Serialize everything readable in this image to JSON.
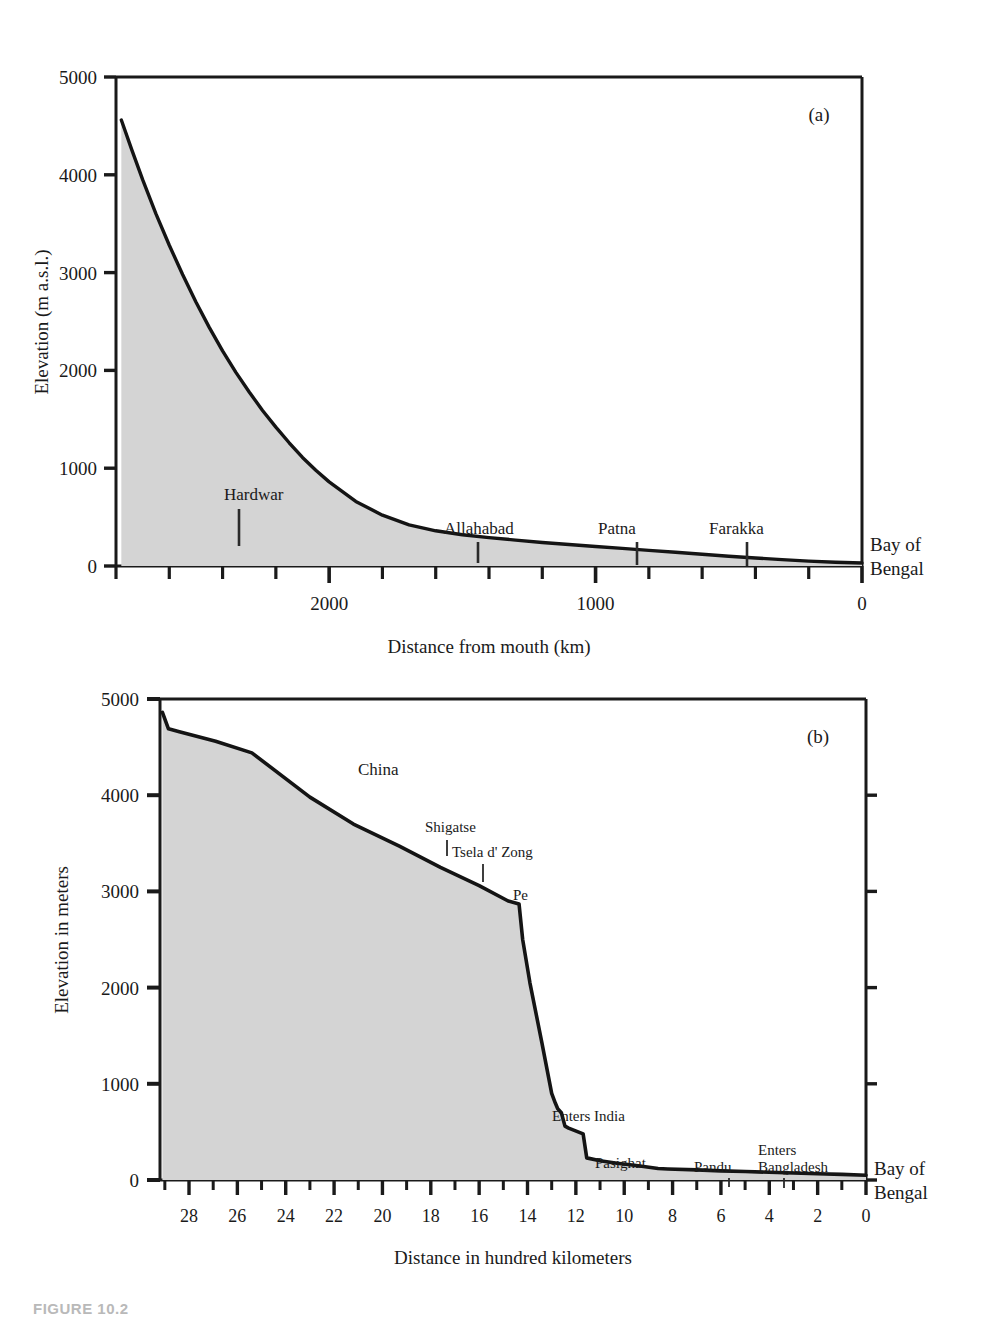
{
  "figure": {
    "caption": "FIGURE 10.2",
    "panels": [
      "(a)",
      "(b)"
    ]
  },
  "chart_data": [
    {
      "id": "panel-a",
      "type": "area",
      "title": "",
      "panel_label": "(a)",
      "xlabel": "Distance from mouth (km)",
      "ylabel": "Elevation (m a.s.l.)",
      "xlim": [
        2800,
        0
      ],
      "ylim": [
        0,
        5000
      ],
      "x_ticks_major": [
        2000,
        1000,
        0
      ],
      "x_tick_labels": [
        "2000",
        "1000",
        "0"
      ],
      "x_ticks_minor": [
        2800,
        2600,
        2400,
        2200,
        1800,
        1600,
        1400,
        1200,
        800,
        600,
        400,
        200
      ],
      "y_ticks": [
        0,
        1000,
        2000,
        3000,
        4000,
        5000
      ],
      "y_tick_labels": [
        "0",
        "1000",
        "2000",
        "3000",
        "4000",
        "5000"
      ],
      "grid": false,
      "legend": "none",
      "axis_inverted_x": true,
      "fill_color": "#d4d4d4",
      "line_color": "#141414",
      "x": [
        2780,
        2740,
        2700,
        2650,
        2600,
        2550,
        2500,
        2450,
        2400,
        2350,
        2300,
        2250,
        2200,
        2150,
        2100,
        2050,
        2000,
        1900,
        1800,
        1700,
        1600,
        1500,
        1400,
        1300,
        1200,
        1100,
        1000,
        900,
        800,
        700,
        600,
        500,
        400,
        300,
        200,
        100,
        0
      ],
      "y": [
        4560,
        4250,
        3950,
        3600,
        3280,
        2980,
        2700,
        2440,
        2200,
        1980,
        1780,
        1590,
        1420,
        1260,
        1110,
        980,
        860,
        660,
        520,
        420,
        360,
        320,
        290,
        265,
        240,
        220,
        200,
        180,
        160,
        140,
        120,
        100,
        82,
        65,
        50,
        38,
        30
      ],
      "annotations": [
        {
          "label": "Hardwar",
          "x": 2070,
          "y": 600
        },
        {
          "label": "Allahabad",
          "x": 1370,
          "y": 180
        },
        {
          "label": "Patna",
          "x": 1010,
          "y": 160
        },
        {
          "label": "Farakka",
          "x": 570,
          "y": 140
        },
        {
          "label": "Bay of\nBengal",
          "x": 0,
          "y": 30
        }
      ],
      "edge_label": "Bay of Bengal"
    },
    {
      "id": "panel-b",
      "type": "area",
      "title": "",
      "panel_label": "(b)",
      "xlabel": "Distance in hundred kilometers",
      "ylabel": "Elevation in meters",
      "xlim": [
        29.2,
        0
      ],
      "ylim": [
        0,
        5000
      ],
      "x_ticks_major": [
        28,
        26,
        24,
        22,
        20,
        18,
        16,
        14,
        12,
        10,
        8,
        6,
        4,
        2,
        0
      ],
      "x_tick_labels": [
        "28",
        "26",
        "24",
        "22",
        "20",
        "18",
        "16",
        "14",
        "12",
        "10",
        "8",
        "6",
        "4",
        "2",
        "0"
      ],
      "x_ticks_minor": [
        29,
        27,
        25,
        23,
        21,
        19,
        17,
        15,
        13,
        11,
        9,
        7,
        5,
        3,
        1
      ],
      "y_ticks": [
        0,
        1000,
        2000,
        3000,
        4000,
        5000
      ],
      "y_tick_labels": [
        "0",
        "1000",
        "2000",
        "3000",
        "4000",
        "5000"
      ],
      "grid": false,
      "legend": "none",
      "axis_inverted_x": true,
      "fill_color": "#d4d4d4",
      "line_color": "#141414",
      "x": [
        29.1,
        28.85,
        28.4,
        26.9,
        25.4,
        23.0,
        21.2,
        19.3,
        17.6,
        16.0,
        14.8,
        14.35,
        14.2,
        13.9,
        13.4,
        13.0,
        12.85,
        12.75,
        12.6,
        12.45,
        12.3,
        11.7,
        11.55,
        11.0,
        10.3,
        9.5,
        8.6,
        8.2,
        7.0,
        6.0,
        5.0,
        4.0,
        3.0,
        2.0,
        1.0,
        0.0
      ],
      "y": [
        4860,
        4690,
        4660,
        4560,
        4440,
        3980,
        3700,
        3470,
        3250,
        3060,
        2900,
        2870,
        2500,
        2050,
        1420,
        900,
        800,
        740,
        700,
        560,
        540,
        480,
        230,
        200,
        175,
        150,
        120,
        115,
        105,
        95,
        88,
        80,
        72,
        65,
        58,
        50
      ],
      "annotations": [
        {
          "label": "China",
          "x": 22.0,
          "y": 3870
        },
        {
          "label": "Shigatse",
          "x": 17.6,
          "y": 3250
        },
        {
          "label": "Tsela d' Zong",
          "x": 15.2,
          "y": 3060
        },
        {
          "label": "Pe",
          "x": 14.2,
          "y": 2870
        },
        {
          "label": "Enters India",
          "x": 12.9,
          "y": 790
        },
        {
          "label": "Pasighat",
          "x": 11.4,
          "y": 220
        },
        {
          "label": "Pandu",
          "x": 6.0,
          "y": 95
        },
        {
          "label": "Enters Bangladesh",
          "x": 4.0,
          "y": 80
        },
        {
          "label": "Bay of\nBengal",
          "x": 0,
          "y": 50
        }
      ],
      "edge_label": "Bay of Bengal"
    }
  ],
  "panel_a": {
    "panel_label": "(a)",
    "y_axis_title": "Elevation (m a.s.l.)",
    "x_axis_title": "Distance from mouth (km)",
    "y_tick_labels": [
      "5000",
      "4000",
      "3000",
      "2000",
      "1000",
      "0"
    ],
    "x_tick_labels": [
      "2000",
      "1000",
      "0"
    ],
    "places": [
      "Hardwar",
      "Allahabad",
      "Patna",
      "Farakka"
    ],
    "edge_label_line1": "Bay of",
    "edge_label_line2": "Bengal"
  },
  "panel_b": {
    "panel_label": "(b)",
    "y_axis_title": "Elevation in meters",
    "x_axis_title": "Distance in hundred kilometers",
    "y_tick_labels": [
      "5000",
      "4000",
      "3000",
      "2000",
      "1000",
      "0"
    ],
    "x_tick_labels": [
      "28",
      "26",
      "24",
      "22",
      "20",
      "18",
      "16",
      "14",
      "12",
      "10",
      "8",
      "6",
      "4",
      "2",
      "0"
    ],
    "places": [
      "China",
      "Shigatse",
      "Tsela d' Zong",
      "Pe",
      "Enters India",
      "Pasighat",
      "Pandu",
      "Enters",
      "Bangladesh"
    ],
    "place_china": "China",
    "place_shigatse": "Shigatse",
    "place_tsela": "Tsela d' Zong",
    "place_pe": "Pe",
    "place_enters_india": "Enters India",
    "place_pasighat": "Pasighat",
    "place_pandu": "Pandu",
    "place_enters_line1": "Enters",
    "place_enters_line2": "Bangladesh",
    "edge_label_line1": "Bay of",
    "edge_label_line2": "Bengal"
  }
}
